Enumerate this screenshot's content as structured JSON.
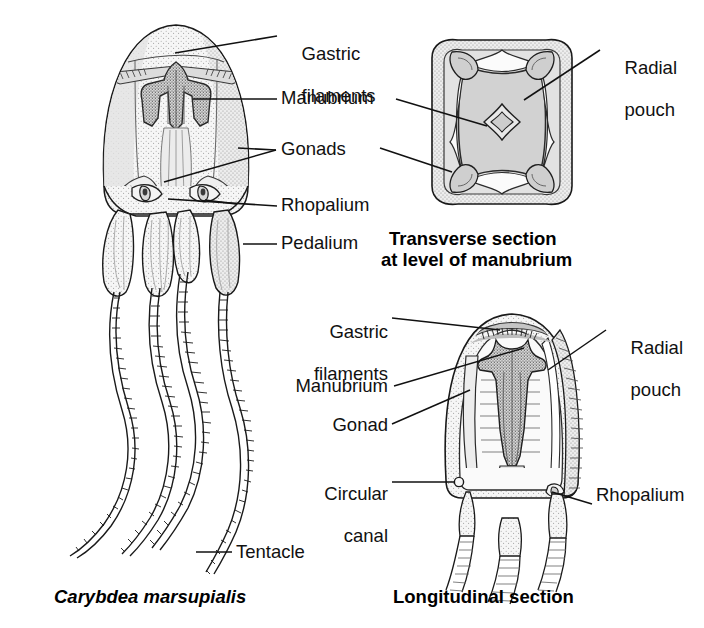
{
  "figure": {
    "title_species": "Carybdea marsupialis",
    "background_color": "#ffffff",
    "ink_color": "#111111",
    "fill_light": "#ececec",
    "fill_mid": "#d4d4d4",
    "fill_dark": "#b4b4b4",
    "stipple_color": "#9a9a9a"
  },
  "panels": {
    "whole_animal": {
      "caption": "Carybdea marsupialis",
      "caption_style": "bold-italic",
      "labels": [
        {
          "key": "gastric_filaments",
          "text_line1": "Gastric",
          "text_line2": "filaments"
        },
        {
          "key": "manubrium",
          "text": "Manubrium"
        },
        {
          "key": "gonads",
          "text": "Gonads"
        },
        {
          "key": "rhopalium",
          "text": "Rhopalium"
        },
        {
          "key": "pedalium",
          "text": "Pedalium"
        },
        {
          "key": "tentacle",
          "text": "Tentacle"
        }
      ]
    },
    "transverse": {
      "caption_line1": "Transverse section",
      "caption_line2": "at level of manubrium",
      "caption_style": "bold",
      "labels": [
        {
          "key": "radial_pouch",
          "text_line1": "Radial",
          "text_line2": "pouch"
        }
      ]
    },
    "longitudinal": {
      "caption": "Longitudinal section",
      "caption_style": "bold",
      "labels": [
        {
          "key": "gastric_filaments",
          "text_line1": "Gastric",
          "text_line2": "filaments"
        },
        {
          "key": "manubrium",
          "text": "Manubrium"
        },
        {
          "key": "gonad",
          "text": "Gonad"
        },
        {
          "key": "circular_canal",
          "text_line1": "Circular",
          "text_line2": "canal"
        },
        {
          "key": "radial_pouch",
          "text_line1": "Radial",
          "text_line2": "pouch"
        },
        {
          "key": "rhopalium",
          "text": "Rhopalium"
        }
      ]
    }
  }
}
